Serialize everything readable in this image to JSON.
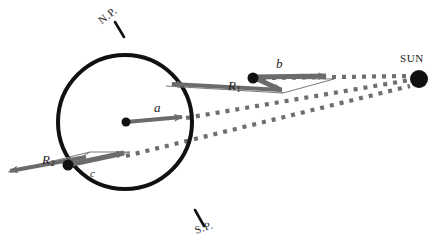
{
  "figure": {
    "type": "astronomy-diagram",
    "background_color": "#ffffff",
    "outline_color": "#111111",
    "vector_color": "#6b6b6b",
    "dot_color": "#111111",
    "ray_color": "#6e6e6e"
  },
  "sphere": {
    "name": "planet-sphere",
    "center_x": 125,
    "center_y": 122,
    "radius": 67,
    "stroke_width": 4
  },
  "labels": {
    "north_pole": "N.P.",
    "south_pole": "S.P.",
    "sun": "SUN"
  },
  "vectors": [
    {
      "id": "a",
      "label": "a",
      "subscript": "",
      "description": "rotation axis vector from sphere center pointing right",
      "x1": 125,
      "y1": 122,
      "x2": 186,
      "y2": 117
    },
    {
      "id": "b",
      "label": "b",
      "subscript": "",
      "description": "vector at upper-right surface point pointing right toward the Sun direction",
      "x1": 253,
      "y1": 78,
      "x2": 330,
      "y2": 76
    },
    {
      "id": "c",
      "label": "c",
      "subscript": "",
      "description": "vector at lower-left surface point pointing right",
      "x1": 68,
      "y1": 165,
      "x2": 126,
      "y2": 155
    },
    {
      "id": "R1",
      "label": "R",
      "subscript": "1",
      "description": "radius vector at upper-right surface point pointing left",
      "x1": 280,
      "y1": 88,
      "x2": 168,
      "y2": 83
    },
    {
      "id": "R2",
      "label": "R",
      "subscript": "2",
      "description": "radius vector at lower-left surface point pointing left",
      "x1": 86,
      "y1": 158,
      "x2": 6,
      "y2": 172
    }
  ],
  "surface_points": [
    {
      "id": "point-b",
      "x": 253,
      "y": 78
    },
    {
      "id": "point-c",
      "x": 68,
      "y": 165
    },
    {
      "id": "point-center",
      "x": 125,
      "y": 122
    }
  ],
  "sun": {
    "name": "sun-disc",
    "x": 419,
    "y": 78,
    "radius": 9
  },
  "sun_rays": [
    {
      "id": "ray-top",
      "x1": 262,
      "y1": 78,
      "x2": 412,
      "y2": 76,
      "dotted": true
    },
    {
      "id": "ray-middle",
      "x1": 188,
      "y1": 118,
      "x2": 412,
      "y2": 80,
      "dotted": true
    },
    {
      "id": "ray-bottom",
      "x1": 128,
      "y1": 155,
      "x2": 412,
      "y2": 86,
      "dotted": true
    }
  ],
  "pole_ticks": [
    {
      "id": "tick-north",
      "x1": 124,
      "y1": 36,
      "x2": 116,
      "y2": 22
    },
    {
      "id": "tick-south",
      "x1": 196,
      "y1": 211,
      "x2": 204,
      "y2": 225
    }
  ],
  "label_positions": {
    "north_pole": {
      "x": 104,
      "y": 22
    },
    "south_pole": {
      "x": 198,
      "y": 232
    },
    "sun": {
      "x": 402,
      "y": 60
    },
    "a": {
      "x": 155,
      "y": 108
    },
    "b": {
      "x": 277,
      "y": 64
    },
    "c": {
      "x": 92,
      "y": 175
    },
    "R1": {
      "x": 230,
      "y": 86
    },
    "R2": {
      "x": 44,
      "y": 163
    }
  }
}
